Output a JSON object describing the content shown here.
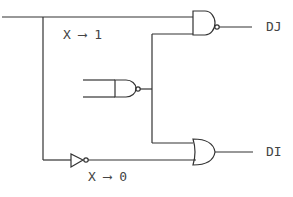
{
  "diagram": {
    "type": "logic-circuit",
    "labels": {
      "x_high": "X ⟶ 1",
      "x_low": "X ⟶ 0",
      "out_dj": "DJ",
      "out_di": "DI"
    },
    "gates": [
      {
        "id": "nand-top",
        "kind": "NAND",
        "output": "DJ"
      },
      {
        "id": "nand-middle",
        "kind": "NAND"
      },
      {
        "id": "not-bottom",
        "kind": "NOT"
      },
      {
        "id": "or-bottom",
        "kind": "OR",
        "output": "DI"
      }
    ],
    "colors": {
      "stroke": "#333333",
      "background": "#ffffff"
    }
  }
}
